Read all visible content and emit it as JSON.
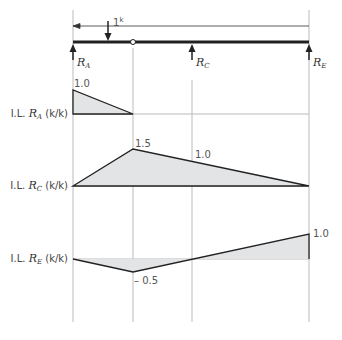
{
  "beam": {
    "load_label": "1",
    "load_unit": "k",
    "supports": [
      {
        "name": "R",
        "sub": "A"
      },
      {
        "name": "R",
        "sub": "C"
      },
      {
        "name": "R",
        "sub": "E"
      }
    ],
    "hinge": "internal hinge"
  },
  "diagrams": [
    {
      "label_prefix": "I.L. ",
      "reaction": "R",
      "sub": "A",
      "unit": " (k/k)",
      "values": {
        "A": "1.0"
      }
    },
    {
      "label_prefix": "I.L. ",
      "reaction": "R",
      "sub": "C",
      "unit": " (k/k)",
      "values": {
        "hinge": "1.5",
        "C": "1.0"
      }
    },
    {
      "label_prefix": "I.L. ",
      "reaction": "R",
      "sub": "E",
      "unit": " (k/k)",
      "values": {
        "hinge": "– 0.5",
        "E": "1.0"
      }
    }
  ],
  "colors": {
    "line": "#222222",
    "fill": "#e2e4e6",
    "grid": "#bbbbbb"
  }
}
